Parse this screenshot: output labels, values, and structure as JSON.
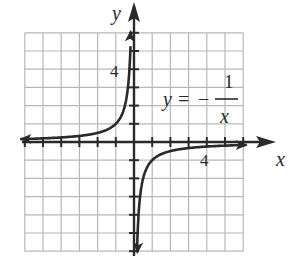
{
  "chart_data": {
    "type": "line",
    "title": "",
    "equation": "y = -1/x",
    "equation_parts": {
      "lhs": "y",
      "eq": "=",
      "sign": "−",
      "numerator": "1",
      "denominator": "x"
    },
    "xlabel": "x",
    "ylabel": "y",
    "xlim": [
      -6,
      6
    ],
    "ylim": [
      -6,
      6
    ],
    "grid": true,
    "grid_step": 1,
    "tick_labels": {
      "x": [
        "4"
      ],
      "y": [
        "4"
      ]
    },
    "x_tick_values": [
      4
    ],
    "y_tick_values": [
      4
    ],
    "series": [
      {
        "name": "y = -1/x (left branch, x<0)",
        "x": [
          -6,
          -5,
          -4,
          -3,
          -2,
          -1,
          -0.5,
          -0.25,
          -0.2,
          -0.1667
        ],
        "y": [
          0.1667,
          0.2,
          0.25,
          0.3333,
          0.5,
          1,
          2,
          4,
          5,
          6
        ]
      },
      {
        "name": "y = -1/x (right branch, x>0)",
        "x": [
          0.1667,
          0.2,
          0.25,
          0.5,
          1,
          2,
          3,
          4,
          5,
          6
        ],
        "y": [
          -6,
          -5,
          -4,
          -2,
          -1,
          -0.5,
          -0.3333,
          -0.25,
          -0.2,
          -0.1667
        ]
      }
    ],
    "asymptotes": {
      "vertical": "x = 0",
      "horizontal": "y = 0"
    }
  },
  "labels": {
    "x_axis": "x",
    "y_axis": "y",
    "x_tick": "4",
    "y_tick": "4",
    "eq_lhs": "y",
    "eq_equals": "=",
    "eq_minus": "−",
    "eq_num": "1",
    "eq_den": "x"
  },
  "colors": {
    "grid": "#b8b8b8",
    "axis": "#2a2a2a",
    "curve": "#2a2a2a",
    "background": "#ffffff"
  }
}
